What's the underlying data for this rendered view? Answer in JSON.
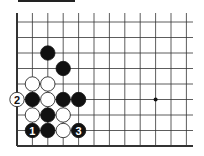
{
  "diagram": {
    "type": "go-board",
    "grid": {
      "columns_x": [
        17,
        32.4,
        47.8,
        63.2,
        78.6,
        94,
        109.4,
        124.8,
        140.2,
        155.6,
        171,
        186.4
      ],
      "rows_y": [
        22,
        37.5,
        53,
        68.5,
        84,
        99.5,
        115,
        130.5,
        146
      ],
      "right_extent": 193,
      "top_extent": 13,
      "left_edge": true,
      "bottom_edge": true
    },
    "star_points": [
      {
        "col": 9,
        "row": 5
      }
    ],
    "stones": [
      {
        "col": 2,
        "row": 2,
        "color": "black",
        "label": ""
      },
      {
        "col": 3,
        "row": 3,
        "color": "black",
        "label": ""
      },
      {
        "col": 1,
        "row": 4,
        "color": "white",
        "label": ""
      },
      {
        "col": 2,
        "row": 4,
        "color": "white",
        "label": ""
      },
      {
        "col": 0,
        "row": 5,
        "color": "white",
        "label": "2"
      },
      {
        "col": 1,
        "row": 5,
        "color": "black",
        "label": ""
      },
      {
        "col": 2,
        "row": 5,
        "color": "white",
        "label": ""
      },
      {
        "col": 3,
        "row": 5,
        "color": "black",
        "label": ""
      },
      {
        "col": 4,
        "row": 5,
        "color": "black",
        "label": ""
      },
      {
        "col": 1,
        "row": 6,
        "color": "white",
        "label": ""
      },
      {
        "col": 2,
        "row": 6,
        "color": "black",
        "label": ""
      },
      {
        "col": 3,
        "row": 6,
        "color": "white",
        "label": ""
      },
      {
        "col": 1,
        "row": 7,
        "color": "black",
        "label": "1"
      },
      {
        "col": 2,
        "row": 7,
        "color": "black",
        "label": ""
      },
      {
        "col": 3,
        "row": 7,
        "color": "white",
        "label": ""
      },
      {
        "col": 4,
        "row": 7,
        "color": "black",
        "label": "3"
      }
    ],
    "colors": {
      "black": "#111111",
      "white": "#ffffff",
      "line": "#333333"
    }
  }
}
